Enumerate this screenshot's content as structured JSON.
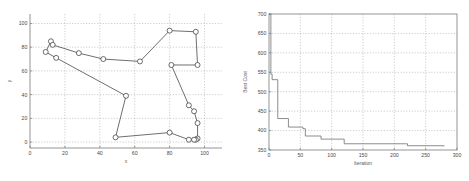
{
  "figure": {
    "background": "#ffffff",
    "panel_count": 2
  },
  "chart_data": [
    {
      "type": "line",
      "id": "tsp-tour",
      "title": "",
      "xlabel": "x",
      "ylabel": "y",
      "xlim": [
        0,
        110
      ],
      "ylim": [
        -5,
        108
      ],
      "xticks": [
        0,
        20,
        40,
        60,
        80,
        100
      ],
      "yticks": [
        0,
        20,
        40,
        60,
        80,
        100
      ],
      "xticklabels": [
        "0",
        "20",
        "40",
        "60",
        "80",
        "100"
      ],
      "yticklabels": [
        "0",
        "20",
        "40",
        "60",
        "80",
        "100"
      ],
      "grid": true,
      "legend": "none",
      "marker": "circle-open",
      "line_color": "#303030",
      "marker_face": "#ffffff",
      "series": [
        {
          "name": "tour",
          "closed": true,
          "points": [
            [
              9,
              76
            ],
            [
              12,
              85
            ],
            [
              13,
              82
            ],
            [
              28,
              75
            ],
            [
              42,
              70
            ],
            [
              63,
              68
            ],
            [
              80,
              94
            ],
            [
              95,
              93
            ],
            [
              96,
              65
            ],
            [
              81,
              65
            ],
            [
              91,
              31
            ],
            [
              94,
              26
            ],
            [
              96,
              16
            ],
            [
              96,
              3
            ],
            [
              95,
              2
            ],
            [
              94,
              2
            ],
            [
              91,
              2
            ],
            [
              80,
              8
            ],
            [
              49,
              4
            ],
            [
              55,
              39
            ],
            [
              15,
              71
            ]
          ]
        }
      ]
    },
    {
      "type": "line",
      "id": "best-cost-convergence",
      "title": "",
      "xlabel": "Iteration",
      "ylabel": "Best Cost",
      "xlim": [
        0,
        300
      ],
      "ylim": [
        350,
        700
      ],
      "xticks": [
        0,
        50,
        100,
        150,
        200,
        250,
        300
      ],
      "yticks": [
        350,
        400,
        450,
        500,
        550,
        600,
        650,
        700
      ],
      "xticklabels": [
        "0",
        "50",
        "100",
        "150",
        "200",
        "250",
        "300"
      ],
      "yticklabels": [
        "350",
        "400",
        "450",
        "500",
        "550",
        "600",
        "650",
        "700"
      ],
      "grid": true,
      "legend": "none",
      "line_color": "#707070",
      "step": "post",
      "series": [
        {
          "name": "Best Cost",
          "points": [
            [
              0,
              700
            ],
            [
              2,
              700
            ],
            [
              3,
              545
            ],
            [
              5,
              531
            ],
            [
              13,
              531
            ],
            [
              14,
              431
            ],
            [
              30,
              431
            ],
            [
              31,
              409
            ],
            [
              52,
              409
            ],
            [
              54,
              405
            ],
            [
              57,
              405
            ],
            [
              58,
              386
            ],
            [
              81,
              386
            ],
            [
              83,
              378
            ],
            [
              117,
              378
            ],
            [
              120,
              366
            ],
            [
              218,
              366
            ],
            [
              221,
              361
            ],
            [
              280,
              361
            ]
          ]
        }
      ]
    }
  ]
}
